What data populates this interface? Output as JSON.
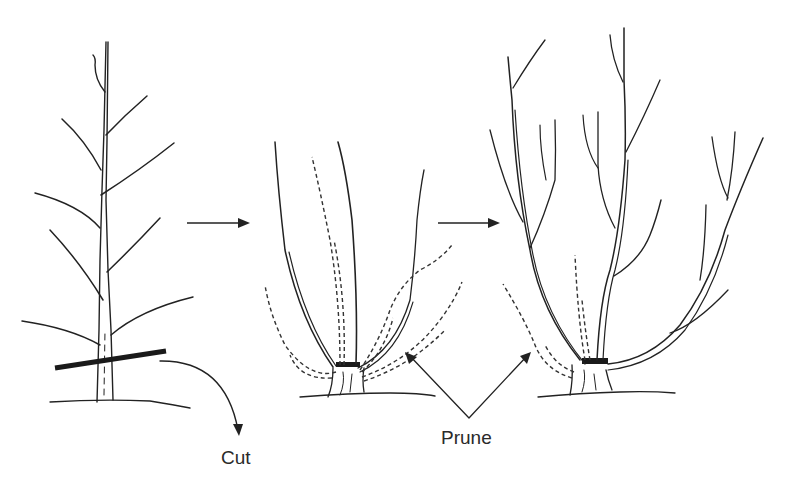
{
  "diagram": {
    "type": "tree pruning illustration",
    "stages": [
      {
        "name": "young-tree",
        "description": "Single-trunk whip with lateral branches, cut line near base"
      },
      {
        "name": "regrowth",
        "description": "Multiple shoots from stump; dashed shoots to be pruned"
      },
      {
        "name": "established-shrub",
        "description": "Multi-stem open framework; dashed shoots to be pruned"
      }
    ],
    "labels": {
      "cut": "Cut",
      "prune": "Prune"
    },
    "colors": {
      "line": "#222222",
      "cut_bar": "#1a1a1a",
      "background": "#ffffff"
    }
  }
}
